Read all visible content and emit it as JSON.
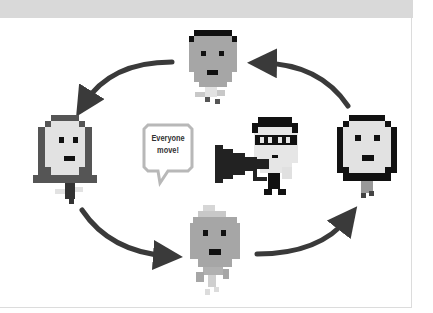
{
  "scene": {
    "description": "Pixel-art people arranged in a circle with curved arrows indicating rotation; center person with glasses shouts through a megaphone",
    "speech_bubble": {
      "line1": "Everyone",
      "line2": "move!"
    },
    "colors": {
      "header_band": "#d9d9d9",
      "arrow": "#3a3a3a",
      "hair_dark": "#111111",
      "hair_gray": "#555555",
      "face_mid": "#a6a6a6",
      "face_light": "#e2e2e2",
      "bubble_border": "#b8b8b8"
    },
    "figures": [
      {
        "id": "top",
        "hair": "black",
        "face": "mid-gray"
      },
      {
        "id": "left",
        "hair": "dark-gray",
        "face": "light-gray"
      },
      {
        "id": "right",
        "hair": "black",
        "face": "light-gray"
      },
      {
        "id": "bottom",
        "hair": "light",
        "face": "mid-gray"
      },
      {
        "id": "center",
        "glasses": true,
        "megaphone": true
      }
    ],
    "arrows": [
      "top-to-left",
      "left-to-bottom",
      "bottom-to-right",
      "right-to-top"
    ]
  }
}
